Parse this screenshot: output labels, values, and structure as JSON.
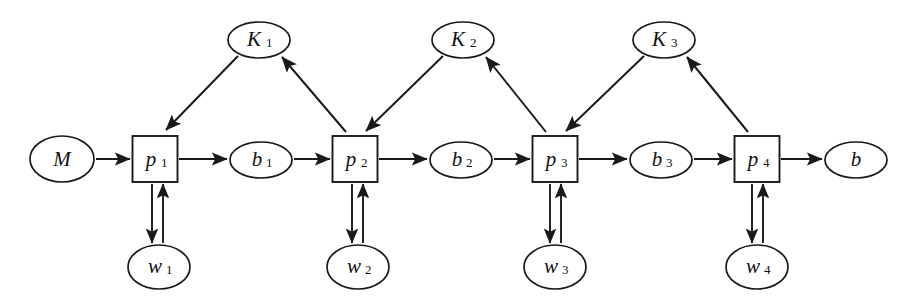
{
  "diagram": {
    "type": "block-flow-diagram",
    "background_color": "#ffffff",
    "stroke_color": "#1a1a1a",
    "width": 917,
    "height": 307,
    "nodes": [
      {
        "id": "M",
        "label": "M",
        "sub": "",
        "shape": "ellipse",
        "cx": 62,
        "cy": 159,
        "rx": 32,
        "ry": 23
      },
      {
        "id": "p1",
        "label": "p",
        "sub": "1",
        "shape": "box",
        "cx": 155,
        "cy": 159,
        "w": 45,
        "h": 46
      },
      {
        "id": "b1",
        "label": "b",
        "sub": "1",
        "shape": "ellipse",
        "cx": 261,
        "cy": 160,
        "rx": 31,
        "ry": 18
      },
      {
        "id": "p2",
        "label": "p",
        "sub": "2",
        "shape": "box",
        "cx": 355,
        "cy": 159,
        "w": 45,
        "h": 46
      },
      {
        "id": "b2",
        "label": "b",
        "sub": "2",
        "shape": "ellipse",
        "cx": 461,
        "cy": 160,
        "rx": 31,
        "ry": 18
      },
      {
        "id": "p3",
        "label": "p",
        "sub": "3",
        "shape": "box",
        "cx": 555,
        "cy": 159,
        "w": 45,
        "h": 46
      },
      {
        "id": "b3",
        "label": "b",
        "sub": "3",
        "shape": "ellipse",
        "cx": 661,
        "cy": 160,
        "rx": 31,
        "ry": 18
      },
      {
        "id": "p4",
        "label": "p",
        "sub": "4",
        "shape": "box",
        "cx": 757,
        "cy": 159,
        "w": 45,
        "h": 46
      },
      {
        "id": "b",
        "label": "b",
        "sub": "",
        "shape": "ellipse",
        "cx": 856,
        "cy": 160,
        "rx": 31,
        "ry": 18
      },
      {
        "id": "K1",
        "label": "K",
        "sub": "1",
        "shape": "ellipse",
        "cx": 259,
        "cy": 40,
        "rx": 31,
        "ry": 18
      },
      {
        "id": "K2",
        "label": "K",
        "sub": "2",
        "shape": "ellipse",
        "cx": 463,
        "cy": 40,
        "rx": 31,
        "ry": 18
      },
      {
        "id": "K3",
        "label": "K",
        "sub": "3",
        "shape": "ellipse",
        "cx": 664,
        "cy": 40,
        "rx": 31,
        "ry": 18
      },
      {
        "id": "w1",
        "label": "w",
        "sub": "1",
        "shape": "ellipse",
        "cx": 159,
        "cy": 267,
        "rx": 31,
        "ry": 22
      },
      {
        "id": "w2",
        "label": "w",
        "sub": "2",
        "shape": "ellipse",
        "cx": 358,
        "cy": 267,
        "rx": 31,
        "ry": 22
      },
      {
        "id": "w3",
        "label": "w",
        "sub": "3",
        "shape": "ellipse",
        "cx": 555,
        "cy": 267,
        "rx": 31,
        "ry": 22
      },
      {
        "id": "w4",
        "label": "w",
        "sub": "4",
        "shape": "ellipse",
        "cx": 757,
        "cy": 267,
        "rx": 31,
        "ry": 22
      }
    ],
    "edges": [
      {
        "from": "M",
        "to": "p1",
        "kind": "single-arrow",
        "orientation": "horizontal"
      },
      {
        "from": "p1",
        "to": "b1",
        "kind": "single-arrow",
        "orientation": "horizontal"
      },
      {
        "from": "b1",
        "to": "p2",
        "kind": "single-arrow",
        "orientation": "horizontal"
      },
      {
        "from": "p2",
        "to": "b2",
        "kind": "single-arrow",
        "orientation": "horizontal"
      },
      {
        "from": "b2",
        "to": "p3",
        "kind": "single-arrow",
        "orientation": "horizontal"
      },
      {
        "from": "p3",
        "to": "b3",
        "kind": "single-arrow",
        "orientation": "horizontal"
      },
      {
        "from": "b3",
        "to": "p4",
        "kind": "single-arrow",
        "orientation": "horizontal"
      },
      {
        "from": "p4",
        "to": "b",
        "kind": "single-arrow",
        "orientation": "horizontal"
      },
      {
        "from": "K1",
        "to": "p1",
        "kind": "single-arrow",
        "orientation": "diagonal-down-left"
      },
      {
        "from": "p2",
        "to": "K1",
        "kind": "single-arrow",
        "orientation": "diagonal-up-left"
      },
      {
        "from": "K2",
        "to": "p2",
        "kind": "single-arrow",
        "orientation": "diagonal-down-left"
      },
      {
        "from": "p3",
        "to": "K2",
        "kind": "single-arrow",
        "orientation": "diagonal-up-left"
      },
      {
        "from": "K3",
        "to": "p3",
        "kind": "single-arrow",
        "orientation": "diagonal-down-left"
      },
      {
        "from": "p4",
        "to": "K3",
        "kind": "single-arrow",
        "orientation": "diagonal-up-left"
      },
      {
        "from": "p1",
        "to": "w1",
        "kind": "double-arrow",
        "orientation": "vertical"
      },
      {
        "from": "p2",
        "to": "w2",
        "kind": "double-arrow",
        "orientation": "vertical"
      },
      {
        "from": "p3",
        "to": "w3",
        "kind": "double-arrow",
        "orientation": "vertical"
      },
      {
        "from": "p4",
        "to": "w4",
        "kind": "double-arrow",
        "orientation": "vertical"
      }
    ]
  }
}
